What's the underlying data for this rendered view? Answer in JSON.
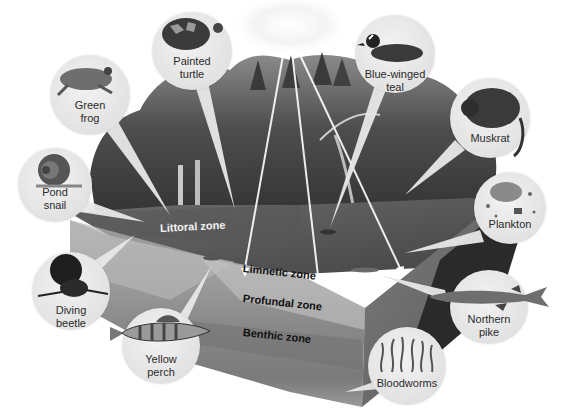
{
  "diagram": {
    "zones": [
      {
        "id": "littoral",
        "label": "Littoral zone"
      },
      {
        "id": "limnetic",
        "label": "Limnetic zone"
      },
      {
        "id": "profundal",
        "label": "Profundal zone"
      },
      {
        "id": "benthic",
        "label": "Benthic zone"
      }
    ],
    "organisms": [
      {
        "id": "green-frog",
        "label_line1": "Green",
        "label_line2": "frog"
      },
      {
        "id": "painted-turtle",
        "label_line1": "Painted",
        "label_line2": "turtle"
      },
      {
        "id": "blue-winged-teal",
        "label_line1": "Blue-winged",
        "label_line2": "teal"
      },
      {
        "id": "muskrat",
        "label_line1": "Muskrat",
        "label_line2": ""
      },
      {
        "id": "pond-snail",
        "label_line1": "Pond",
        "label_line2": "snail"
      },
      {
        "id": "plankton",
        "label_line1": "Plankton",
        "label_line2": ""
      },
      {
        "id": "diving-beetle",
        "label_line1": "Diving",
        "label_line2": "beetle"
      },
      {
        "id": "northern-pike",
        "label_line1": "Northern",
        "label_line2": "pike"
      },
      {
        "id": "yellow-perch",
        "label_line1": "Yellow",
        "label_line2": "perch"
      },
      {
        "id": "bloodworms",
        "label_line1": "Bloodworms",
        "label_line2": ""
      }
    ]
  }
}
